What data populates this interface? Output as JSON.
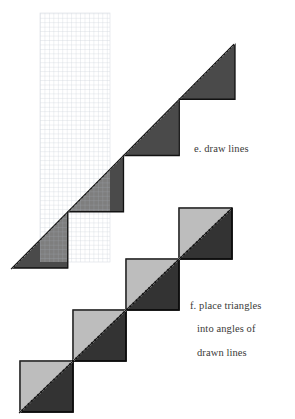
{
  "page": {
    "width": 295,
    "height": 419,
    "background_color": "#ffffff",
    "kind": "instructional-geometry-diagram"
  },
  "colors": {
    "background": "#ffffff",
    "grid_line": "#cfd3da",
    "grid_line_strong": "#bcc2cb",
    "step_fill_upper": "#4a4a4a",
    "step_fill_upper_light": "#575757",
    "step_fill_lower": "#333333",
    "step_fill_lower_light": "#3d3d3d",
    "outline_dark": "#111111",
    "dotted_edge": "#1a1a1a",
    "divider_line": "#8a8a8a",
    "caption_text": "#3a3a38"
  },
  "captions": [
    {
      "id": "caption-e",
      "label": "e. draw lines",
      "lines": [
        "e. draw lines"
      ],
      "x": 194,
      "y": 143
    },
    {
      "id": "caption-f",
      "label": "f. place triangles into angles of drawn lines",
      "lines": [
        "f. place triangles",
        "into angles of",
        "drawn lines"
      ],
      "x": 190,
      "y": 288
    }
  ],
  "figures": {
    "graph_paper": {
      "name": "graph-paper-grid",
      "x": 40,
      "y": 13,
      "width": 70,
      "height": 249,
      "cell_size": 4.45,
      "line_color": "#cfd3da"
    },
    "step_figure_e": {
      "name": "stair-step-triangle-with-drawn-lines",
      "apex": [
        235,
        43
      ],
      "bottom_left": [
        12,
        268
      ],
      "step_count": 4,
      "step_width": 55.75,
      "step_height": 56.25,
      "hypotenuse_style": "dotted",
      "fill": "#4a4a4a",
      "notes": "large right triangle built of four stacked stair steps; thin drawn lines subdivide each step; a secondary diagonal runs inside each step block"
    },
    "step_figure_f": {
      "name": "stair-step-triangle-with-placed-triangles",
      "apex": [
        232,
        208
      ],
      "bottom_left": [
        20,
        412
      ],
      "step_count": 4,
      "step_width": 53,
      "step_height": 51,
      "hypotenuse_style": "dotted",
      "fill": "#333333",
      "notes": "same stair-step outline with square cells outlined and each square split by a diagonal, forming placed triangles"
    }
  },
  "icons": {
    "dotted_edge": "dotted-line-icon",
    "grid": "grid-icon"
  }
}
